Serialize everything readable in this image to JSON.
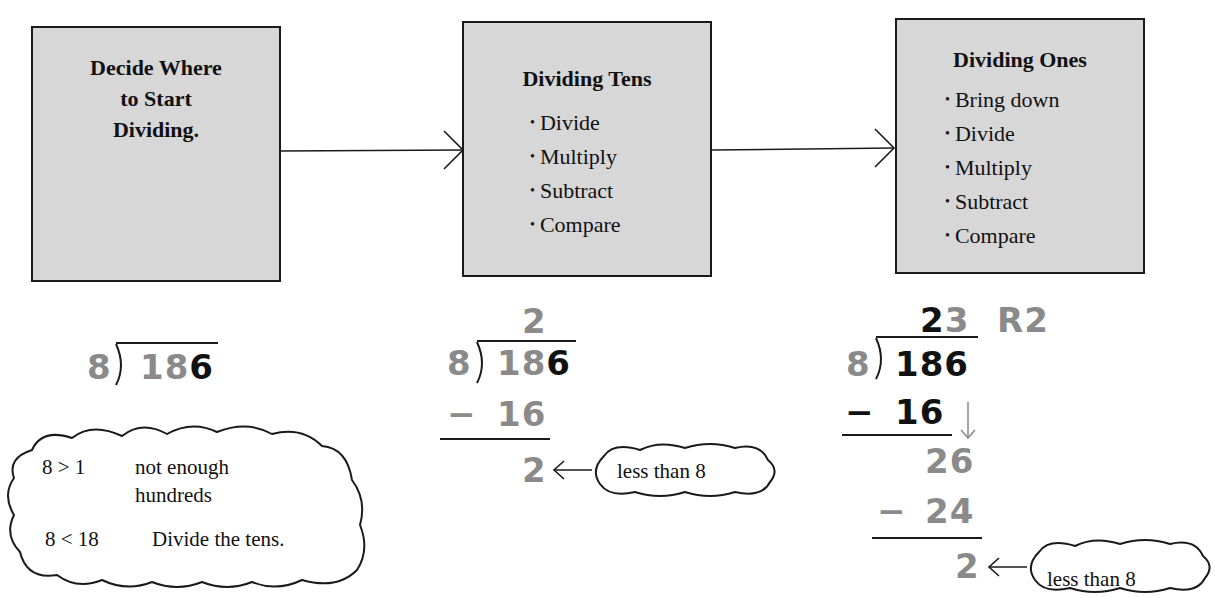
{
  "steps": [
    {
      "title": "Decide Where to Start Dividing.",
      "title_lines": [
        "Decide Where",
        "to Start",
        "Dividing."
      ],
      "items": []
    },
    {
      "title": "Dividing Tens",
      "items": [
        "Divide",
        "Multiply",
        "Subtract",
        "Compare"
      ]
    },
    {
      "title": "Dividing Ones",
      "items": [
        "Bring down",
        "Divide",
        "Multiply",
        "Subtract",
        "Compare"
      ]
    }
  ],
  "colors": {
    "box_fill": "#d7d7d7",
    "gray_digit": "#8a8a8a",
    "black_digit": "#111111"
  },
  "example1": {
    "divisor": "8",
    "dividend_gray": "18",
    "dividend_black": "6",
    "cloud": {
      "row1_left": "8 > 1",
      "row1_right": "not enough",
      "row1_right2": "hundreds",
      "row2_left": "8 < 18",
      "row2_right": "Divide the tens."
    }
  },
  "example2": {
    "quotient": "2",
    "divisor": "8",
    "dividend_gray": "18",
    "dividend_black": "6",
    "minus": "−",
    "product": "16",
    "remainder": "2",
    "callout": "less than 8"
  },
  "example3": {
    "quotient_black": "2",
    "quotient_gray": "3",
    "remainder_label": "R2",
    "divisor": "8",
    "dividend": "186",
    "minus": "−",
    "product1": "16",
    "bring_down": "26",
    "product2": "24",
    "remainder": "2",
    "callout": "less than 8"
  }
}
